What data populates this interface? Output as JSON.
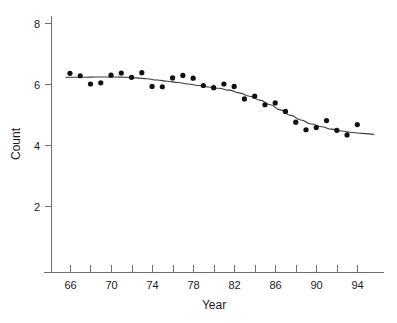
{
  "chart_data": {
    "type": "scatter",
    "title": "",
    "xlabel": "Year",
    "ylabel": "Count",
    "xlim": [
      64.2,
      96.6
    ],
    "ylim": [
      0.9,
      8.55
    ],
    "grid": false,
    "legend": "none",
    "x_tick_values": [
      66,
      68,
      70,
      72,
      74,
      76,
      78,
      80,
      82,
      84,
      86,
      88,
      90,
      92,
      94
    ],
    "x_tick_labels": [
      "66",
      "",
      "70",
      "",
      "74",
      "",
      "78",
      "",
      "82",
      "",
      "86",
      "",
      "90",
      "",
      "94"
    ],
    "x_labeled_ticks": [
      66,
      70,
      74,
      78,
      82,
      86,
      90,
      94
    ],
    "y_tick_values": [
      2,
      4,
      6,
      8
    ],
    "y_tick_labels": [
      "2",
      "4",
      "6",
      "8"
    ],
    "x": [
      66.0,
      67.0,
      68.0,
      69.0,
      70.0,
      71.0,
      72.0,
      73.0,
      74.0,
      75.0,
      76.0,
      77.0,
      78.0,
      79.0,
      80.0,
      81.0,
      82.0,
      83.0,
      84.0,
      85.0,
      86.0,
      87.0,
      88.0,
      89.0,
      90.0,
      91.0,
      92.0,
      93.0,
      94.0
    ],
    "y": [
      6.35,
      6.27,
      6.0,
      6.04,
      6.29,
      6.36,
      6.22,
      6.37,
      5.92,
      5.91,
      6.2,
      6.28,
      6.19,
      5.95,
      5.88,
      6.0,
      5.92,
      5.51,
      5.6,
      5.32,
      5.38,
      5.1,
      4.75,
      4.5,
      4.57,
      4.8,
      4.48,
      4.33,
      4.67
    ],
    "series": [
      {
        "name": "Count",
        "type": "scatter",
        "values": [
          6.35,
          6.27,
          6.0,
          6.04,
          6.29,
          6.36,
          6.22,
          6.37,
          5.92,
          5.91,
          6.2,
          6.28,
          6.19,
          5.95,
          5.88,
          6.0,
          5.92,
          5.51,
          5.6,
          5.32,
          5.38,
          5.1,
          4.75,
          4.5,
          4.57,
          4.8,
          4.48,
          4.33,
          4.67
        ]
      },
      {
        "name": "smooth-fit",
        "type": "line",
        "x": [
          65.6,
          66.5,
          67.5,
          68.5,
          69.5,
          70.5,
          71.5,
          72.5,
          73.5,
          74.5,
          75.5,
          76.5,
          77.5,
          78.5,
          79.5,
          80.5,
          81.5,
          82.5,
          83.5,
          84.5,
          85.5,
          86.5,
          87.5,
          88.5,
          89.5,
          90.5,
          91.5,
          92.5,
          93.5,
          94.5,
          95.6
        ],
        "values": [
          6.22,
          6.22,
          6.22,
          6.23,
          6.23,
          6.23,
          6.22,
          6.2,
          6.17,
          6.13,
          6.09,
          6.05,
          6.0,
          5.95,
          5.9,
          5.86,
          5.8,
          5.71,
          5.6,
          5.47,
          5.32,
          5.15,
          4.97,
          4.82,
          4.69,
          4.6,
          4.52,
          4.46,
          4.41,
          4.38,
          4.35
        ]
      }
    ]
  },
  "axes": {
    "y_axis_name": "count-axis",
    "x_axis_name": "year-axis"
  }
}
